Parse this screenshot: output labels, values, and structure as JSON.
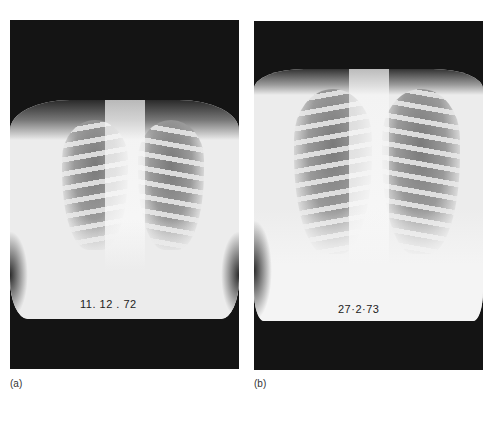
{
  "figure": {
    "panels": [
      {
        "id": "a",
        "caption": "(a)",
        "film_date": "11. 12 . 72",
        "content": "chest-x-ray"
      },
      {
        "id": "b",
        "caption": "(b)",
        "film_date": "27·2·73",
        "content": "chest-x-ray"
      }
    ]
  }
}
